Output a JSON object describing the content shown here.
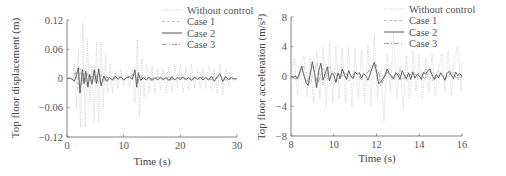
{
  "chart_data": [
    {
      "type": "line",
      "title": "",
      "xlabel": "Time (s)",
      "ylabel": "Top floor displacement (m)",
      "xlim": [
        0,
        30
      ],
      "ylim": [
        -0.12,
        0.12
      ],
      "xticks": [
        0,
        10,
        20,
        30
      ],
      "xtick_labels": [
        "0",
        "10",
        "20",
        "30"
      ],
      "yticks": [
        0.12,
        0.06,
        0,
        -0.06,
        -0.12
      ],
      "ytick_labels": [
        "0.12",
        "0.06",
        "0",
        "−0.06",
        "−0.12"
      ],
      "grid": false,
      "legend_position": "upper right",
      "series": [
        {
          "name": "Without control",
          "style": "dotted",
          "color": "#c8c8c8",
          "x": [
            0,
            0.5,
            1,
            1.3,
            1.7,
            2.0,
            2.4,
            2.8,
            3.2,
            3.6,
            4.0,
            4.4,
            4.8,
            5.2,
            5.6,
            6.0,
            6.4,
            6.8,
            7.2,
            7.6,
            8.0,
            8.5,
            9,
            9.5,
            10,
            10.5,
            11,
            11.5,
            12,
            12.4,
            12.8,
            13.2,
            13.6,
            14,
            14.5,
            15,
            15.5,
            16,
            16.5,
            17,
            17.5,
            18,
            18.5,
            19,
            19.5,
            20,
            20.5,
            21,
            21.5,
            22,
            22.5,
            23,
            23.5,
            24,
            24.5,
            25,
            25.5,
            26,
            26.5,
            27,
            27.5,
            28,
            28.5,
            29,
            29.5,
            30
          ],
          "y": [
            0,
            0.002,
            -0.004,
            0.03,
            -0.06,
            0.06,
            -0.1,
            0.115,
            -0.1,
            0.08,
            -0.05,
            0.03,
            -0.09,
            0.075,
            -0.09,
            0.075,
            -0.06,
            0.05,
            -0.03,
            0.03,
            -0.03,
            0.015,
            -0.02,
            0.02,
            -0.015,
            0.015,
            -0.02,
            0.02,
            -0.05,
            0.08,
            -0.08,
            0.04,
            -0.04,
            0.03,
            -0.03,
            0.025,
            -0.03,
            0.02,
            -0.025,
            0.02,
            -0.03,
            0.025,
            -0.03,
            0.03,
            -0.02,
            0.03,
            -0.03,
            0.025,
            -0.025,
            0.03,
            -0.02,
            0.02,
            -0.02,
            0.02,
            -0.02,
            0.025,
            -0.025,
            0.02,
            -0.03,
            0.03,
            -0.03,
            0.02,
            -0.015,
            0.01,
            -0.005,
            0
          ]
        },
        {
          "name": "Case 1",
          "style": "dashed",
          "color": "#b4b4b4",
          "x": [
            0,
            1,
            1.5,
            2,
            2.3,
            2.7,
            3,
            3.5,
            4,
            4.5,
            5,
            5.5,
            6,
            6.5,
            7,
            8,
            9,
            10,
            11,
            12,
            12.3,
            12.6,
            13,
            14,
            15,
            16,
            17,
            18,
            19,
            20,
            21,
            22,
            23,
            24,
            25,
            26,
            27,
            28,
            29,
            30
          ],
          "y": [
            0,
            -0.002,
            0.015,
            -0.02,
            0.02,
            -0.012,
            0.018,
            -0.015,
            0.008,
            -0.01,
            0.015,
            -0.01,
            0.01,
            -0.008,
            0.005,
            -0.004,
            0.005,
            -0.003,
            0.003,
            0.01,
            -0.012,
            0.008,
            -0.004,
            0.003,
            -0.003,
            0.003,
            -0.003,
            0.003,
            -0.002,
            0.003,
            -0.003,
            0.003,
            -0.002,
            0.002,
            -0.003,
            0.004,
            -0.004,
            0.003,
            -0.002,
            0
          ]
        },
        {
          "name": "Case 2",
          "style": "solid",
          "color": "#555555",
          "x": [
            0,
            0.5,
            1,
            1.3,
            1.7,
            2.0,
            2.3,
            2.7,
            3,
            3.3,
            3.7,
            4,
            4.4,
            4.8,
            5.2,
            5.6,
            6,
            6.5,
            7,
            7.5,
            8,
            8.5,
            9,
            9.5,
            10,
            10.5,
            11,
            11.5,
            12,
            12.3,
            12.6,
            13,
            13.5,
            14,
            14.5,
            15,
            15.5,
            16,
            16.5,
            17,
            17.5,
            18,
            18.5,
            19,
            19.5,
            20,
            20.5,
            21,
            21.5,
            22,
            22.5,
            23,
            23.5,
            24,
            24.5,
            25,
            25.5,
            26,
            26.5,
            27,
            27.5,
            28,
            28.5,
            29,
            29.5,
            30
          ],
          "y": [
            0,
            0.001,
            -0.002,
            -0.006,
            0.008,
            0.022,
            -0.03,
            0.018,
            -0.01,
            0.015,
            -0.018,
            0.008,
            -0.012,
            0.018,
            -0.01,
            0.02,
            -0.015,
            0.005,
            -0.006,
            0.002,
            -0.003,
            0.005,
            -0.002,
            0.004,
            -0.003,
            0.002,
            0.004,
            -0.002,
            0.018,
            -0.018,
            0.012,
            -0.004,
            0.002,
            -0.003,
            0.003,
            -0.004,
            0.002,
            -0.003,
            0.003,
            -0.002,
            0.002,
            -0.004,
            0.004,
            -0.003,
            0.002,
            -0.002,
            0.003,
            -0.002,
            0.002,
            -0.004,
            0.003,
            -0.002,
            0.003,
            -0.003,
            0.002,
            -0.003,
            0.005,
            -0.006,
            0.004,
            0.01,
            -0.006,
            0.004,
            -0.002,
            0.002,
            -0.001,
            0
          ]
        },
        {
          "name": "Case 3",
          "style": "dashdot",
          "color": "#8c8c8c",
          "x": [
            0,
            1,
            1.5,
            2,
            2.4,
            2.8,
            3.2,
            3.6,
            4,
            4.5,
            5,
            5.5,
            6,
            7,
            8,
            9,
            10,
            11,
            12,
            12.4,
            12.8,
            14,
            16,
            18,
            20,
            22,
            24,
            26,
            27,
            28,
            30
          ],
          "y": [
            0,
            0,
            0.01,
            0.015,
            -0.022,
            0.012,
            -0.008,
            0.012,
            -0.006,
            0.01,
            -0.008,
            0.012,
            -0.006,
            0.003,
            -0.003,
            0.004,
            -0.002,
            0.003,
            0.012,
            -0.014,
            0.006,
            -0.002,
            0.002,
            -0.003,
            0.002,
            -0.002,
            0.003,
            -0.004,
            0.006,
            -0.003,
            0
          ]
        }
      ]
    },
    {
      "type": "line",
      "title": "",
      "xlabel": "Time (s)",
      "ylabel": "Top floor acceleration (m/s²)",
      "xlim": [
        8,
        16
      ],
      "ylim": [
        -8,
        8
      ],
      "xticks": [
        8,
        10,
        12,
        14,
        16
      ],
      "xtick_labels": [
        "8",
        "10",
        "12",
        "14",
        "16"
      ],
      "yticks": [
        8,
        4,
        0,
        -4,
        -8
      ],
      "ytick_labels": [
        "8",
        "4",
        "0",
        "−4",
        "−8"
      ],
      "grid": false,
      "legend_position": "upper right",
      "series": [
        {
          "name": "Without control",
          "style": "dotted",
          "color": "#c8c8c8",
          "x": [
            8,
            8.15,
            8.3,
            8.45,
            8.6,
            8.75,
            8.9,
            9.05,
            9.2,
            9.35,
            9.5,
            9.65,
            9.8,
            9.95,
            10.1,
            10.25,
            10.4,
            10.55,
            10.7,
            10.85,
            11,
            11.15,
            11.3,
            11.45,
            11.6,
            11.75,
            11.9,
            12.05,
            12.2,
            12.35,
            12.5,
            12.65,
            12.8,
            12.95,
            13.1,
            13.25,
            13.4,
            13.55,
            13.7,
            13.85,
            14,
            14.15,
            14.3,
            14.45,
            14.6,
            14.75,
            14.9,
            15.05,
            15.2,
            15.35,
            15.5,
            15.65,
            15.8,
            15.95,
            16
          ],
          "y": [
            0,
            2.5,
            -2.5,
            1.5,
            2.8,
            -2.8,
            2.5,
            -3.5,
            3.5,
            -3,
            4,
            -4,
            4.5,
            -3.5,
            4,
            -3,
            3.8,
            -3.5,
            4,
            -4,
            3.8,
            -3,
            3.5,
            -3.5,
            4.2,
            -4,
            5.5,
            -3,
            1,
            -6,
            3,
            -2,
            5.8,
            -3,
            1.5,
            -4.5,
            3,
            -3,
            3.5,
            -2,
            3,
            -3,
            2.5,
            -2,
            3,
            -2.5,
            1,
            3,
            -2,
            3.5,
            -2.5,
            2.5,
            4,
            -2,
            2
          ]
        },
        {
          "name": "Case 1",
          "style": "dashed",
          "color": "#b4b4b4",
          "x": [
            8,
            8.3,
            8.6,
            8.9,
            9.2,
            9.5,
            9.8,
            10.1,
            10.4,
            10.7,
            11,
            11.3,
            11.6,
            11.9,
            12.2,
            12.5,
            12.8,
            13.1,
            13.4,
            13.7,
            14,
            14.3,
            14.6,
            14.9,
            15.2,
            15.5,
            15.8,
            16
          ],
          "y": [
            0,
            -0.5,
            1.5,
            -1,
            1.8,
            -1.2,
            1.5,
            -0.8,
            1,
            -0.6,
            0.8,
            -0.5,
            0.6,
            2,
            -1.2,
            0.8,
            -0.5,
            0.9,
            -0.6,
            0.8,
            -0.5,
            1,
            -0.6,
            0.7,
            -0.5,
            0.8,
            -0.5,
            0
          ]
        },
        {
          "name": "Case 2",
          "style": "solid",
          "color": "#555555",
          "x": [
            8,
            8.1,
            8.2,
            8.3,
            8.4,
            8.5,
            8.6,
            8.7,
            8.8,
            8.9,
            9,
            9.1,
            9.2,
            9.3,
            9.4,
            9.5,
            9.6,
            9.7,
            9.8,
            9.9,
            10,
            10.1,
            10.2,
            10.3,
            10.4,
            10.5,
            10.6,
            10.7,
            10.8,
            10.9,
            11,
            11.1,
            11.2,
            11.3,
            11.4,
            11.5,
            11.6,
            11.7,
            11.8,
            11.9,
            12,
            12.1,
            12.2,
            12.3,
            12.4,
            12.5,
            12.6,
            12.7,
            12.8,
            12.9,
            13,
            13.1,
            13.2,
            13.3,
            13.4,
            13.5,
            13.6,
            13.7,
            13.8,
            13.9,
            14,
            14.1,
            14.2,
            14.3,
            14.4,
            14.5,
            14.6,
            14.7,
            14.8,
            14.9,
            15,
            15.1,
            15.2,
            15.3,
            15.4,
            15.5,
            15.6,
            15.7,
            15.8,
            15.9,
            16
          ],
          "y": [
            0,
            -0.2,
            0.1,
            -0.3,
            0.5,
            1.4,
            0.2,
            -0.8,
            -1.2,
            0.3,
            2,
            0.5,
            -1.5,
            0.8,
            1.8,
            -0.5,
            0.4,
            1.3,
            -0.6,
            0.4,
            0.3,
            -0.8,
            0.5,
            -0.3,
            1,
            0.2,
            -0.4,
            0.8,
            0.1,
            -0.3,
            0.6,
            0.3,
            0.5,
            -0.2,
            0.4,
            0.1,
            -0.5,
            0.3,
            1.2,
            1.9,
            0.6,
            -1,
            -0.7,
            -0.3,
            0.2,
            1,
            0.4,
            0.1,
            -0.3,
            0.5,
            0.2,
            -0.4,
            0.8,
            0.2,
            -0.3,
            0.5,
            -0.4,
            0.6,
            -0.2,
            0.3,
            0.1,
            -0.4,
            0.6,
            0.3,
            0.8,
            1,
            0.2,
            -0.4,
            0.3,
            -0.2,
            0.5,
            0.1,
            -0.5,
            0.4,
            0.7,
            0.2,
            -0.3,
            0.6,
            0.1,
            0.4,
            0
          ]
        },
        {
          "name": "Case 3",
          "style": "dashdot",
          "color": "#8c8c8c",
          "x": [
            8,
            8.25,
            8.5,
            8.75,
            9,
            9.25,
            9.5,
            9.75,
            10,
            10.25,
            10.5,
            10.75,
            11,
            11.25,
            11.5,
            11.75,
            12,
            12.25,
            12.5,
            12.75,
            13,
            13.25,
            13.5,
            13.75,
            14,
            14.25,
            14.5,
            14.75,
            15,
            15.25,
            15.5,
            15.75,
            16
          ],
          "y": [
            0,
            -0.4,
            1,
            -0.7,
            1.5,
            -1,
            1.2,
            -0.5,
            0.7,
            -0.4,
            0.6,
            -0.3,
            0.5,
            -0.2,
            0.4,
            0.9,
            1.5,
            -0.9,
            0.6,
            -0.3,
            0.5,
            -0.4,
            0.6,
            -0.3,
            0.5,
            -0.3,
            0.8,
            -0.3,
            0.4,
            -0.3,
            0.5,
            -0.2,
            0
          ]
        }
      ]
    }
  ]
}
